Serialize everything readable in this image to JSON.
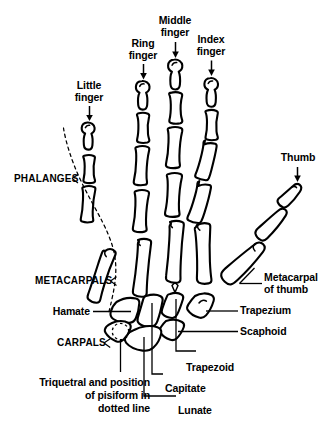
{
  "figure": {
    "style": "black-and-white line drawing",
    "ink_color": "#000000",
    "background_color": "#ffffff"
  },
  "finger_labels": [
    {
      "id": "little",
      "text": "Little\nfinger",
      "arrow": "down"
    },
    {
      "id": "ring",
      "text": "Ring\nfinger",
      "arrow": "down"
    },
    {
      "id": "middle",
      "text": "Middle\nfinger",
      "arrow": "down"
    },
    {
      "id": "index",
      "text": "Index\nfinger",
      "arrow": "down"
    },
    {
      "id": "thumb",
      "text": "Thumb",
      "arrow": "down"
    }
  ],
  "region_labels": [
    {
      "id": "phalanges",
      "text": "PHALANGES"
    },
    {
      "id": "metacarpals",
      "text": "METACARPALS"
    },
    {
      "id": "carpals",
      "text": "CARPALS"
    }
  ],
  "bone_labels": [
    {
      "id": "metacarpal-of-thumb",
      "text": "Metacarpal\nof thumb",
      "side": "right"
    },
    {
      "id": "trapezium",
      "text": "Trapezium",
      "side": "right"
    },
    {
      "id": "scaphoid",
      "text": "Scaphoid",
      "side": "right"
    },
    {
      "id": "hamate",
      "text": "Hamate",
      "side": "left"
    },
    {
      "id": "trapezoid",
      "text": "Trapezoid",
      "side": "bottom"
    },
    {
      "id": "capitate",
      "text": "Capitate",
      "side": "bottom"
    },
    {
      "id": "lunate",
      "text": "Lunate",
      "side": "bottom"
    },
    {
      "id": "triquetral",
      "text": "Triquetral and position\nof pisiform in\ndotted line",
      "side": "bottom"
    }
  ]
}
